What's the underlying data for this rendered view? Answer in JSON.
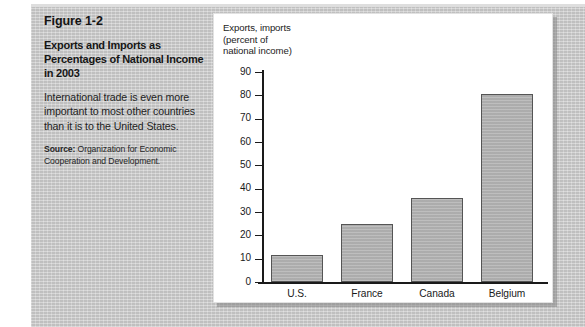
{
  "figure": {
    "number": "Figure 1-2",
    "title": "Exports and Imports as Percentages of National Income in 2003",
    "description": "International trade is even more important to most other countries than it is to the United States.",
    "source_label": "Source:",
    "source_text": " Organization for Economic Cooperation and Development."
  },
  "colors": {
    "background_gray": "#c8c8c8",
    "panel_white": "#ffffff",
    "bar_fill": "#b2b2b2",
    "bar_border": "#555555",
    "axis": "#1a1a1a",
    "text": "#1a1a1a"
  },
  "chart_data": {
    "type": "bar",
    "title": "",
    "axis_caption": "Exports, imports\n(percent of\nnational income)",
    "categories": [
      "U.S.",
      "France",
      "Canada",
      "Belgium"
    ],
    "values": [
      11.5,
      25,
      36,
      80.5
    ],
    "xlabel": "",
    "ylabel": "Exports, imports (percent of national income)",
    "ylim": [
      0,
      90
    ],
    "ytick_step": 10,
    "yticks": [
      0,
      10,
      20,
      30,
      40,
      50,
      60,
      70,
      80,
      90
    ],
    "ytick_labels": [
      "0",
      "10",
      "20",
      "30",
      "40",
      "50",
      "60",
      "70",
      "80",
      "90"
    ],
    "grid": false,
    "legend": null,
    "series": [
      {
        "name": "Exports and imports as percent of national income",
        "values": [
          11.5,
          25,
          36,
          80.5
        ]
      }
    ]
  }
}
